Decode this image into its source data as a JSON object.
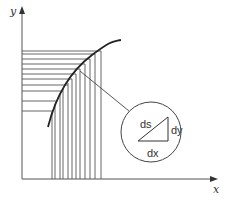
{
  "diagram": {
    "axes": {
      "x_label": "x",
      "y_label": "y"
    },
    "magnifier": {
      "hypotenuse_label": "ds",
      "vertical_label": "dy",
      "horizontal_label": "dx"
    },
    "colors": {
      "line": "#555555",
      "curve": "#222222",
      "text": "#333333"
    },
    "horizontal_lines_y": [
      51,
      54,
      59,
      64,
      69,
      74,
      79,
      85,
      91,
      101,
      111
    ],
    "vertical_lines_x": [
      52,
      55,
      60,
      63,
      68,
      72,
      76,
      80,
      85,
      90,
      95,
      101
    ]
  }
}
